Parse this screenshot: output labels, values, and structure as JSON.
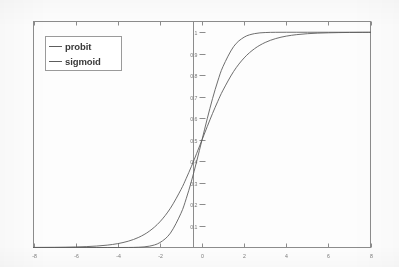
{
  "figure": {
    "background_color": "#fdfdfd",
    "frame_color": "#8c8c8c",
    "axis_color": "#8c8c8c",
    "tick_label_color": "#7a7a7a"
  },
  "legend": {
    "position": "top-left",
    "border_color": "#9a9a9a",
    "entries": [
      {
        "label": "probit",
        "color": "#5d5d5d"
      },
      {
        "label": "sigmoid",
        "color": "#5d5d5d"
      }
    ]
  },
  "chart_data": {
    "type": "line",
    "title": "",
    "subtitle": "",
    "xlabel": "",
    "ylabel": "",
    "xlim": [
      -8,
      8
    ],
    "ylim": [
      0,
      1.05
    ],
    "grid": false,
    "legend_position": "top-left",
    "xticks": [
      -8,
      -6,
      -4,
      -2,
      0,
      2,
      4,
      6,
      8
    ],
    "xticklabels": [
      "-8",
      "-6",
      "-4",
      "-2",
      "0",
      "2",
      "4",
      "6",
      "8"
    ],
    "yticks": [
      0.1,
      0.2,
      0.3,
      0.4,
      0.5,
      0.6,
      0.7,
      0.8,
      0.9,
      1
    ],
    "yticklabels": [
      "0.1",
      "0.2",
      "0.3",
      "0.4",
      "0.5",
      "0.6",
      "0.7",
      "0.8",
      "0.9",
      "1"
    ],
    "x": [
      -8,
      -7.5,
      -7,
      -6.5,
      -6,
      -5.5,
      -5,
      -4.5,
      -4,
      -3.5,
      -3,
      -2.5,
      -2,
      -1.5,
      -1,
      -0.75,
      -0.5,
      -0.25,
      0,
      0.25,
      0.5,
      0.75,
      1,
      1.5,
      2,
      2.5,
      3,
      3.5,
      4,
      4.5,
      5,
      5.5,
      6,
      6.5,
      7,
      7.5,
      8
    ],
    "series": [
      {
        "name": "probit",
        "color": "#5d5d5d",
        "values": [
          0.0,
          0.0,
          0.0,
          0.0,
          0.0,
          0.0,
          0.0,
          0.0,
          0.0,
          0.0002,
          0.0013,
          0.0062,
          0.0228,
          0.0668,
          0.1587,
          0.2266,
          0.3085,
          0.4013,
          0.5,
          0.5987,
          0.6915,
          0.7734,
          0.8413,
          0.9332,
          0.9772,
          0.9938,
          0.9987,
          0.9998,
          1.0,
          1.0,
          1.0,
          1.0,
          1.0,
          1.0,
          1.0,
          1.0,
          1.0
        ]
      },
      {
        "name": "sigmoid",
        "color": "#5d5d5d",
        "values": [
          0.0003,
          0.0006,
          0.0009,
          0.0015,
          0.0025,
          0.0041,
          0.0067,
          0.011,
          0.018,
          0.0293,
          0.0474,
          0.0759,
          0.1192,
          0.1824,
          0.2689,
          0.3208,
          0.3775,
          0.4378,
          0.5,
          0.5622,
          0.6225,
          0.6792,
          0.7311,
          0.8176,
          0.8808,
          0.9241,
          0.9526,
          0.9707,
          0.982,
          0.989,
          0.9933,
          0.9959,
          0.9975,
          0.9985,
          0.9991,
          0.9994,
          0.9997
        ]
      }
    ]
  }
}
